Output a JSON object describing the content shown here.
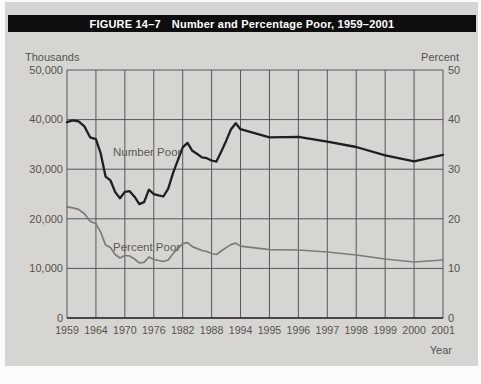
{
  "figure": {
    "label": "FIGURE 14–7",
    "title": "Number and Percentage Poor, 1959–2001"
  },
  "chart_data": {
    "type": "line",
    "title": "Number and Percentage Poor, 1959–2001",
    "grid": true,
    "legend_position": "inline-labels",
    "left_axis": {
      "label": "Thousands",
      "min": 0,
      "max": 50000,
      "ticks": [
        "50,000",
        "40,000",
        "30,000",
        "20,000",
        "10,000",
        "0"
      ]
    },
    "right_axis": {
      "label": "Percent",
      "min": 0,
      "max": 50,
      "ticks": [
        "50",
        "40",
        "30",
        "20",
        "10",
        "0"
      ]
    },
    "x_axis": {
      "label": "Year",
      "tick_years": [
        "1959",
        "1964",
        "1970",
        "1976",
        "1982",
        "1988",
        "1994",
        "1995",
        "1996",
        "1997",
        "1998",
        "1999",
        "2000",
        "2001"
      ]
    },
    "years": [
      1959,
      1960,
      1961,
      1962,
      1963,
      1964,
      1965,
      1966,
      1967,
      1968,
      1969,
      1970,
      1971,
      1972,
      1973,
      1974,
      1975,
      1976,
      1977,
      1978,
      1979,
      1980,
      1981,
      1982,
      1983,
      1984,
      1985,
      1986,
      1987,
      1988,
      1989,
      1990,
      1991,
      1992,
      1993,
      1994,
      1995,
      1996,
      1997,
      1998,
      1999,
      2000,
      2001
    ],
    "series": [
      {
        "name": "Number Poor",
        "axis": "left",
        "color": "#1f1f1f",
        "stroke_width": 2.3,
        "values": [
          39490,
          39851,
          39628,
          38625,
          36436,
          36055,
          33185,
          28510,
          27769,
          25389,
          24147,
          25420,
          25559,
          24460,
          22973,
          23370,
          25877,
          24975,
          24720,
          24497,
          26072,
          29272,
          31822,
          34398,
          35303,
          33700,
          33064,
          32370,
          32221,
          31745,
          31528,
          33585,
          35708,
          38014,
          39265,
          38059,
          36425,
          36529,
          35574,
          34476,
          32791,
          31581,
          32907
        ]
      },
      {
        "name": "Percent Poor",
        "axis": "right",
        "color": "#7b7b78",
        "stroke_width": 1.7,
        "values": [
          22.4,
          22.2,
          21.9,
          21.0,
          19.5,
          19.0,
          17.3,
          14.7,
          14.2,
          12.8,
          12.1,
          12.6,
          12.5,
          11.9,
          11.1,
          11.2,
          12.3,
          11.8,
          11.6,
          11.4,
          11.7,
          13.0,
          14.0,
          15.0,
          15.2,
          14.4,
          14.0,
          13.6,
          13.4,
          13.0,
          12.8,
          13.5,
          14.2,
          14.8,
          15.1,
          14.5,
          13.8,
          13.7,
          13.3,
          12.7,
          11.9,
          11.3,
          11.7
        ]
      }
    ]
  }
}
